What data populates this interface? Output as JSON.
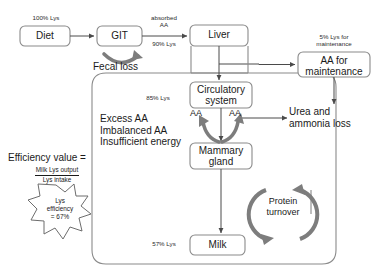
{
  "diagram": {
    "colors": {
      "box_stroke": "#8a8a8a",
      "thin_arrow": "#4a4a4a",
      "thick_arrow": "#7d7d7d",
      "text": "#1a1a1a",
      "background": "#ffffff"
    }
  },
  "nodes": {
    "diet": "Diet",
    "git": "GIT",
    "liver": "Liver",
    "aa_maintenance": "AA for\nmaintenance",
    "circulatory": "Circulatory\nsystem",
    "mammary": "Mammary\ngland",
    "milk": "Milk"
  },
  "flow_labels": {
    "intake": "100% Lys",
    "absorbed": "absorbed\nAA",
    "absorbed_pct": "90% Lys",
    "fecal_loss": "Fecal loss",
    "maintenance_pct": "5% Lys for\nmaintenance",
    "circulatory_pct": "85% Lys",
    "milk_pct": "57% Lys",
    "urea_loss": "Urea and\nammonia loss",
    "aa_left": "AA",
    "aa_right": "AA",
    "protein_turnover": "Protein\nturnover"
  },
  "constraints": {
    "lines": "Excess AA\nImbalanced AA\nInsufficient energy"
  },
  "efficiency": {
    "title": "Efficiency value =",
    "numerator": "Milk Lys output",
    "denominator": "Lys intake",
    "badge": "Lys\nefficiency\n= 67%"
  }
}
